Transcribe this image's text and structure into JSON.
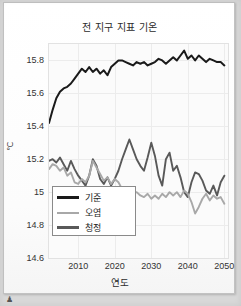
{
  "chart_data": {
    "type": "line",
    "title": "전 지구 지표 기온",
    "xlabel": "연도",
    "ylabel": "℃",
    "xlim": [
      2002,
      2051
    ],
    "ylim": [
      14.6,
      15.9
    ],
    "xticks": [
      "2010",
      "2020",
      "2030",
      "2040",
      "2050"
    ],
    "xtick_values": [
      2010,
      2020,
      2030,
      2040,
      2050
    ],
    "yticks": [
      "15.8",
      "15.6",
      "15.4",
      "15.2",
      "15",
      "14.8",
      "14.6"
    ],
    "ytick_values": [
      15.8,
      15.6,
      15.4,
      15.2,
      15.0,
      14.8,
      14.6
    ],
    "grid": true,
    "legend_position": "lower-left",
    "series": [
      {
        "name": "기준",
        "color": "#1a1a1a",
        "x": [
          2002,
          2003,
          2004,
          2005,
          2006,
          2007,
          2008,
          2009,
          2010,
          2011,
          2012,
          2013,
          2014,
          2015,
          2016,
          2017,
          2018,
          2019,
          2020,
          2021,
          2022,
          2023,
          2024,
          2025,
          2026,
          2027,
          2028,
          2029,
          2030,
          2031,
          2032,
          2033,
          2034,
          2035,
          2036,
          2037,
          2038,
          2039,
          2040,
          2041,
          2042,
          2043,
          2044,
          2045,
          2046,
          2047,
          2048,
          2049,
          2050
        ],
        "values": [
          15.42,
          15.5,
          15.57,
          15.61,
          15.63,
          15.64,
          15.66,
          15.69,
          15.72,
          15.75,
          15.73,
          15.76,
          15.73,
          15.75,
          15.72,
          15.74,
          15.71,
          15.76,
          15.78,
          15.8,
          15.8,
          15.79,
          15.78,
          15.77,
          15.79,
          15.78,
          15.79,
          15.77,
          15.78,
          15.79,
          15.81,
          15.8,
          15.78,
          15.8,
          15.82,
          15.8,
          15.83,
          15.86,
          15.81,
          15.83,
          15.8,
          15.83,
          15.81,
          15.79,
          15.81,
          15.8,
          15.79,
          15.79,
          15.77
        ]
      },
      {
        "name": "오염",
        "color": "#a8a8a8",
        "x": [
          2002,
          2003,
          2004,
          2005,
          2006,
          2007,
          2008,
          2009,
          2010,
          2011,
          2012,
          2013,
          2014,
          2015,
          2016,
          2017,
          2018,
          2019,
          2020,
          2021,
          2022,
          2023,
          2024,
          2025,
          2026,
          2027,
          2028,
          2029,
          2030,
          2031,
          2032,
          2033,
          2034,
          2035,
          2036,
          2037,
          2038,
          2039,
          2040,
          2041,
          2042,
          2043,
          2044,
          2045,
          2046,
          2047,
          2048,
          2049,
          2050
        ],
        "values": [
          15.14,
          15.17,
          15.16,
          15.13,
          15.15,
          15.1,
          15.12,
          15.06,
          15.05,
          15.08,
          15.06,
          15.1,
          15.19,
          15.15,
          15.11,
          15.07,
          15.09,
          15.05,
          15.08,
          15.06,
          15.02,
          15.0,
          14.99,
          14.99,
          15.0,
          14.98,
          14.97,
          14.99,
          14.96,
          14.98,
          14.96,
          14.99,
          14.97,
          15.0,
          14.98,
          15.0,
          14.97,
          15.01,
          14.99,
          14.94,
          14.87,
          14.91,
          14.96,
          14.99,
          14.95,
          14.98,
          14.96,
          14.97,
          14.93
        ]
      },
      {
        "name": "청정",
        "color": "#595959",
        "x": [
          2002,
          2003,
          2004,
          2005,
          2006,
          2007,
          2008,
          2009,
          2010,
          2011,
          2012,
          2013,
          2014,
          2015,
          2016,
          2017,
          2018,
          2019,
          2020,
          2021,
          2022,
          2023,
          2024,
          2025,
          2026,
          2027,
          2028,
          2029,
          2030,
          2031,
          2032,
          2033,
          2034,
          2035,
          2036,
          2037,
          2038,
          2039,
          2040,
          2041,
          2042,
          2043,
          2044,
          2045,
          2046,
          2047,
          2048,
          2049,
          2050
        ],
        "values": [
          15.19,
          15.2,
          15.18,
          15.21,
          15.17,
          15.13,
          15.19,
          15.14,
          15.1,
          15.07,
          15.04,
          15.1,
          15.2,
          15.16,
          15.08,
          15.05,
          15.09,
          15.04,
          15.08,
          15.13,
          15.2,
          15.26,
          15.32,
          15.26,
          15.2,
          15.16,
          15.13,
          15.21,
          15.3,
          15.22,
          15.1,
          15.04,
          15.2,
          15.24,
          15.13,
          15.16,
          15.09,
          15.0,
          14.97,
          15.06,
          15.12,
          15.11,
          15.07,
          15.01,
          14.99,
          15.04,
          14.98,
          15.06,
          15.1
        ]
      }
    ]
  },
  "legend": {
    "items": [
      {
        "label": "기준",
        "color": "#1a1a1a"
      },
      {
        "label": "오염",
        "color": "#a8a8a8"
      },
      {
        "label": "청정",
        "color": "#595959"
      }
    ]
  },
  "artifact": {
    "glyph": "♟"
  }
}
